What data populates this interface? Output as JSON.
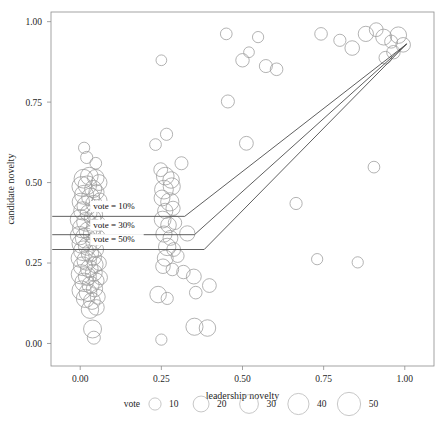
{
  "chart_data": {
    "type": "scatter",
    "title": "",
    "subtitle": "",
    "xlabel": "leadership novelty",
    "ylabel": "candidate novelty",
    "xlim": [
      -0.09,
      1.09
    ],
    "ylim": [
      -0.07,
      1.03
    ],
    "xticks": [
      0.0,
      0.25,
      0.5,
      0.75,
      1.0
    ],
    "xticklabels": [
      "0.00",
      "0.25",
      "0.50",
      "0.75",
      "1.00"
    ],
    "yticks": [
      0.0,
      0.25,
      0.5,
      0.75,
      1.0
    ],
    "yticklabels": [
      "0.00",
      "0.25",
      "0.50",
      "0.75",
      "1.00"
    ],
    "grid": false,
    "legend": {
      "title": "vote",
      "position": "bottom",
      "entries": [
        {
          "label": "10",
          "size": 10
        },
        {
          "label": "20",
          "size": 20
        },
        {
          "label": "30",
          "size": 30
        },
        {
          "label": "40",
          "size": 40
        },
        {
          "label": "50",
          "size": 50
        }
      ]
    },
    "size_encoding": "vote",
    "marker": "open-circle",
    "marker_color": "#9a9a9a",
    "points": [
      {
        "x": 0.01,
        "y": 0.512,
        "size": 30
      },
      {
        "x": 0.028,
        "y": 0.52,
        "size": 26
      },
      {
        "x": 0.048,
        "y": 0.515,
        "size": 22
      },
      {
        "x": 0.005,
        "y": 0.488,
        "size": 34
      },
      {
        "x": 0.022,
        "y": 0.492,
        "size": 29
      },
      {
        "x": 0.04,
        "y": 0.48,
        "size": 24
      },
      {
        "x": 0.058,
        "y": 0.5,
        "size": 20
      },
      {
        "x": 0.012,
        "y": 0.462,
        "size": 31
      },
      {
        "x": 0.032,
        "y": 0.455,
        "size": 27
      },
      {
        "x": 0.05,
        "y": 0.47,
        "size": 18
      },
      {
        "x": 0.002,
        "y": 0.44,
        "size": 25
      },
      {
        "x": 0.02,
        "y": 0.428,
        "size": 33
      },
      {
        "x": 0.042,
        "y": 0.435,
        "size": 21
      },
      {
        "x": 0.06,
        "y": 0.445,
        "size": 16
      },
      {
        "x": 0.008,
        "y": 0.412,
        "size": 28
      },
      {
        "x": 0.026,
        "y": 0.405,
        "size": 23
      },
      {
        "x": 0.045,
        "y": 0.4,
        "size": 19
      },
      {
        "x": 0.0,
        "y": 0.385,
        "size": 35
      },
      {
        "x": 0.018,
        "y": 0.378,
        "size": 30
      },
      {
        "x": 0.038,
        "y": 0.39,
        "size": 22
      },
      {
        "x": 0.056,
        "y": 0.372,
        "size": 17
      },
      {
        "x": 0.006,
        "y": 0.358,
        "size": 32
      },
      {
        "x": 0.024,
        "y": 0.35,
        "size": 26
      },
      {
        "x": 0.044,
        "y": 0.362,
        "size": 20
      },
      {
        "x": -0.002,
        "y": 0.335,
        "size": 29
      },
      {
        "x": 0.016,
        "y": 0.328,
        "size": 36
      },
      {
        "x": 0.036,
        "y": 0.34,
        "size": 24
      },
      {
        "x": 0.054,
        "y": 0.33,
        "size": 18
      },
      {
        "x": 0.004,
        "y": 0.31,
        "size": 31
      },
      {
        "x": 0.022,
        "y": 0.302,
        "size": 27
      },
      {
        "x": 0.042,
        "y": 0.315,
        "size": 21
      },
      {
        "x": 0.01,
        "y": 0.288,
        "size": 34
      },
      {
        "x": 0.03,
        "y": 0.28,
        "size": 25
      },
      {
        "x": 0.048,
        "y": 0.292,
        "size": 19
      },
      {
        "x": 0.0,
        "y": 0.265,
        "size": 28
      },
      {
        "x": 0.02,
        "y": 0.258,
        "size": 33
      },
      {
        "x": 0.04,
        "y": 0.268,
        "size": 22
      },
      {
        "x": 0.058,
        "y": 0.25,
        "size": 16
      },
      {
        "x": 0.008,
        "y": 0.24,
        "size": 30
      },
      {
        "x": 0.028,
        "y": 0.232,
        "size": 26
      },
      {
        "x": 0.046,
        "y": 0.245,
        "size": 20
      },
      {
        "x": 0.002,
        "y": 0.215,
        "size": 32
      },
      {
        "x": 0.022,
        "y": 0.208,
        "size": 27
      },
      {
        "x": 0.042,
        "y": 0.22,
        "size": 23
      },
      {
        "x": 0.062,
        "y": 0.205,
        "size": 15
      },
      {
        "x": 0.012,
        "y": 0.19,
        "size": 29
      },
      {
        "x": 0.032,
        "y": 0.182,
        "size": 24
      },
      {
        "x": 0.05,
        "y": 0.195,
        "size": 18
      },
      {
        "x": 0.004,
        "y": 0.165,
        "size": 31
      },
      {
        "x": 0.024,
        "y": 0.158,
        "size": 26
      },
      {
        "x": 0.044,
        "y": 0.17,
        "size": 21
      },
      {
        "x": 0.016,
        "y": 0.14,
        "size": 28
      },
      {
        "x": 0.036,
        "y": 0.132,
        "size": 23
      },
      {
        "x": 0.054,
        "y": 0.145,
        "size": 17
      },
      {
        "x": 0.03,
        "y": 0.105,
        "size": 25
      },
      {
        "x": 0.05,
        "y": 0.112,
        "size": 19
      },
      {
        "x": 0.038,
        "y": 0.045,
        "size": 27
      },
      {
        "x": 0.042,
        "y": 0.018,
        "size": 12
      },
      {
        "x": 0.02,
        "y": 0.578,
        "size": 10
      },
      {
        "x": 0.048,
        "y": 0.56,
        "size": 9
      },
      {
        "x": 0.012,
        "y": 0.608,
        "size": 8
      },
      {
        "x": 0.25,
        "y": 0.88,
        "size": 7
      },
      {
        "x": 0.248,
        "y": 0.54,
        "size": 14
      },
      {
        "x": 0.262,
        "y": 0.52,
        "size": 26
      },
      {
        "x": 0.28,
        "y": 0.508,
        "size": 22
      },
      {
        "x": 0.258,
        "y": 0.478,
        "size": 30
      },
      {
        "x": 0.282,
        "y": 0.488,
        "size": 24
      },
      {
        "x": 0.252,
        "y": 0.452,
        "size": 20
      },
      {
        "x": 0.276,
        "y": 0.44,
        "size": 28
      },
      {
        "x": 0.262,
        "y": 0.412,
        "size": 18
      },
      {
        "x": 0.286,
        "y": 0.42,
        "size": 15
      },
      {
        "x": 0.254,
        "y": 0.385,
        "size": 23
      },
      {
        "x": 0.272,
        "y": 0.368,
        "size": 19
      },
      {
        "x": 0.292,
        "y": 0.375,
        "size": 13
      },
      {
        "x": 0.258,
        "y": 0.34,
        "size": 21
      },
      {
        "x": 0.278,
        "y": 0.328,
        "size": 17
      },
      {
        "x": 0.268,
        "y": 0.3,
        "size": 25
      },
      {
        "x": 0.288,
        "y": 0.292,
        "size": 14
      },
      {
        "x": 0.262,
        "y": 0.265,
        "size": 20
      },
      {
        "x": 0.3,
        "y": 0.272,
        "size": 12
      },
      {
        "x": 0.255,
        "y": 0.24,
        "size": 16
      },
      {
        "x": 0.284,
        "y": 0.23,
        "size": 11
      },
      {
        "x": 0.24,
        "y": 0.152,
        "size": 22
      },
      {
        "x": 0.268,
        "y": 0.14,
        "size": 10
      },
      {
        "x": 0.25,
        "y": 0.012,
        "size": 8
      },
      {
        "x": 0.232,
        "y": 0.618,
        "size": 9
      },
      {
        "x": 0.266,
        "y": 0.65,
        "size": 10
      },
      {
        "x": 0.312,
        "y": 0.56,
        "size": 12
      },
      {
        "x": 0.33,
        "y": 0.342,
        "size": 18
      },
      {
        "x": 0.352,
        "y": 0.052,
        "size": 24
      },
      {
        "x": 0.392,
        "y": 0.048,
        "size": 22
      },
      {
        "x": 0.35,
        "y": 0.208,
        "size": 17
      },
      {
        "x": 0.398,
        "y": 0.18,
        "size": 14
      },
      {
        "x": 0.356,
        "y": 0.158,
        "size": 11
      },
      {
        "x": 0.318,
        "y": 0.222,
        "size": 13
      },
      {
        "x": 0.45,
        "y": 0.962,
        "size": 9
      },
      {
        "x": 0.52,
        "y": 0.905,
        "size": 7
      },
      {
        "x": 0.572,
        "y": 0.862,
        "size": 12
      },
      {
        "x": 0.605,
        "y": 0.852,
        "size": 11
      },
      {
        "x": 0.548,
        "y": 0.952,
        "size": 8
      },
      {
        "x": 0.5,
        "y": 0.88,
        "size": 13
      },
      {
        "x": 0.455,
        "y": 0.752,
        "size": 12
      },
      {
        "x": 0.512,
        "y": 0.622,
        "size": 14
      },
      {
        "x": 0.665,
        "y": 0.435,
        "size": 10
      },
      {
        "x": 0.73,
        "y": 0.262,
        "size": 8
      },
      {
        "x": 0.742,
        "y": 0.962,
        "size": 11
      },
      {
        "x": 0.8,
        "y": 0.942,
        "size": 10
      },
      {
        "x": 0.838,
        "y": 0.918,
        "size": 16
      },
      {
        "x": 0.88,
        "y": 0.962,
        "size": 18
      },
      {
        "x": 0.912,
        "y": 0.975,
        "size": 14
      },
      {
        "x": 0.935,
        "y": 0.952,
        "size": 20
      },
      {
        "x": 0.958,
        "y": 0.938,
        "size": 12
      },
      {
        "x": 0.98,
        "y": 0.958,
        "size": 22
      },
      {
        "x": 0.995,
        "y": 0.928,
        "size": 16
      },
      {
        "x": 0.965,
        "y": 0.905,
        "size": 13
      },
      {
        "x": 0.94,
        "y": 0.888,
        "size": 11
      },
      {
        "x": 0.905,
        "y": 0.548,
        "size": 9
      },
      {
        "x": 0.855,
        "y": 0.252,
        "size": 8
      }
    ],
    "trend_lines": [
      {
        "name": "vote = 10%",
        "label": "vote = 10%",
        "color": "#4d4d4d",
        "points": [
          {
            "x": -0.085,
            "y": 0.395
          },
          {
            "x": 0.322,
            "y": 0.395
          },
          {
            "x": 1.005,
            "y": 0.93
          }
        ],
        "label_x": 0.04,
        "label_y": 0.418
      },
      {
        "name": "vote = 30%",
        "label": "vote = 30%",
        "color": "#4d4d4d",
        "points": [
          {
            "x": -0.085,
            "y": 0.338
          },
          {
            "x": 0.352,
            "y": 0.338
          },
          {
            "x": 1.005,
            "y": 0.93
          }
        ],
        "label_x": 0.04,
        "label_y": 0.36
      },
      {
        "name": "vote = 50%",
        "label": "vote = 50%",
        "color": "#4d4d4d",
        "points": [
          {
            "x": -0.085,
            "y": 0.292
          },
          {
            "x": 0.382,
            "y": 0.292
          },
          {
            "x": 1.005,
            "y": 0.93
          }
        ],
        "label_x": 0.04,
        "label_y": 0.315
      }
    ]
  },
  "figure": {
    "panel": {
      "left": 51,
      "top": 12,
      "right": 434,
      "bottom": 366
    },
    "colors": {
      "background": "#ffffff",
      "panel_border": "#8d8d8d",
      "marker_stroke": "#9a9a9a",
      "line": "#4d4d4d",
      "text": "#1f1f1f"
    }
  }
}
